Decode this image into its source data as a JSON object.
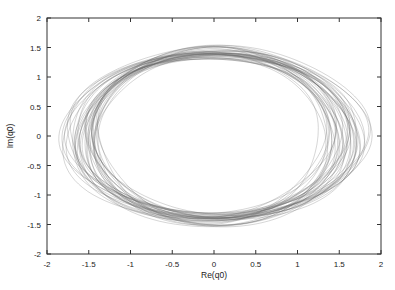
{
  "chart_data": {
    "type": "line",
    "title": "",
    "xlabel": "Re(q0)",
    "ylabel": "Im(q0)",
    "xlim": [
      -2,
      2
    ],
    "ylim": [
      -2,
      2
    ],
    "x_ticks": [
      "-2",
      "-1.5",
      "-1",
      "-0.5",
      "0",
      "0.5",
      "1",
      "1.5",
      "2"
    ],
    "y_ticks": [
      "-2",
      "-1.5",
      "-1",
      "-0.5",
      "0",
      "0.5",
      "1",
      "1.5",
      "2"
    ],
    "grid": false,
    "legend": null,
    "series": [
      {
        "name": "orbit-bundle",
        "kind": "parametric-ellipses",
        "center": [
          0,
          0
        ],
        "re_amplitude_range": [
          1.35,
          1.8
        ],
        "im_amplitude_range": [
          1.35,
          1.5
        ],
        "orbit_count": 40,
        "color": "#6a6a6a"
      }
    ]
  },
  "colors": {
    "background": "#ffffff",
    "axis": "#333333",
    "curve": "#6a6a6a"
  }
}
